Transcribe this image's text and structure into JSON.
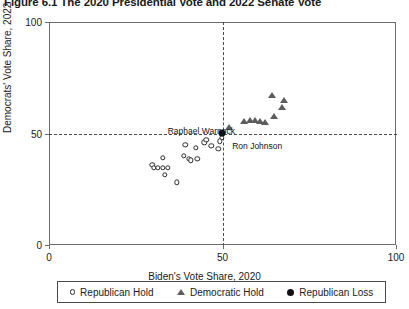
{
  "title": "Figure 6.1  The 2020 Presidential Vote and 2022 Senate Vote",
  "annotations": [
    {
      "name": "raphael-warnock",
      "text": "Raphael Warnock",
      "x": 36.0,
      "y": 51.5
    },
    {
      "name": "ron-johnson",
      "text": "Ron Johnson",
      "x": 52.5,
      "y": 45.0
    }
  ],
  "legend": {
    "items": [
      {
        "name": "republican-hold",
        "label": "Republican Hold",
        "marker": "open-circle",
        "color": "#2b2b2b"
      },
      {
        "name": "democratic-hold",
        "label": "Democratic Hold",
        "marker": "filled-triangle",
        "color": "#5d5d5d"
      },
      {
        "name": "republican-loss",
        "label": "Republican Loss",
        "marker": "filled-circle",
        "color": "#111111"
      }
    ]
  },
  "chart_data": {
    "type": "scatter",
    "title": "Figure 6.1  The 2020 Presidential Vote and 2022 Senate Vote",
    "xlabel": "Biden's Vote Share, 2020",
    "ylabel": "Democrats' Vote Share, 2022",
    "xlim": [
      0,
      100
    ],
    "ylim": [
      0,
      100
    ],
    "xticks": [
      0,
      50,
      100
    ],
    "yticks": [
      0,
      50,
      100
    ],
    "grid": false,
    "reference_lines": [
      {
        "name": "vertical-50",
        "axis": "x",
        "value": 50,
        "style": "dashed"
      },
      {
        "name": "horizontal-50",
        "axis": "y",
        "value": 50,
        "style": "dashed"
      }
    ],
    "legend_position": "below-axes",
    "series": [
      {
        "name": "Republican Hold",
        "marker": "open-circle",
        "color": "#2b2b2b",
        "points": [
          {
            "x": 39.0,
            "y": 45.5
          },
          {
            "x": 42.0,
            "y": 44.0
          },
          {
            "x": 44.5,
            "y": 46.5
          },
          {
            "x": 45.0,
            "y": 47.5
          },
          {
            "x": 46.5,
            "y": 45.0
          },
          {
            "x": 48.5,
            "y": 43.5
          },
          {
            "x": 49.5,
            "y": 48.5
          },
          {
            "x": 49.0,
            "y": 47.0
          },
          {
            "x": 38.5,
            "y": 40.5
          },
          {
            "x": 40.0,
            "y": 39.0
          },
          {
            "x": 40.5,
            "y": 38.5
          },
          {
            "x": 42.5,
            "y": 39.0
          },
          {
            "x": 32.5,
            "y": 39.5
          },
          {
            "x": 29.5,
            "y": 36.5
          },
          {
            "x": 30.0,
            "y": 35.0
          },
          {
            "x": 31.0,
            "y": 35.0
          },
          {
            "x": 32.5,
            "y": 35.0
          },
          {
            "x": 34.0,
            "y": 35.0
          },
          {
            "x": 33.0,
            "y": 32.0
          },
          {
            "x": 36.5,
            "y": 28.5
          }
        ]
      },
      {
        "name": "Democratic Hold",
        "marker": "filled-triangle",
        "color": "#5d5d5d",
        "points": [
          {
            "x": 51.5,
            "y": 53.5
          },
          {
            "x": 56.0,
            "y": 56.0
          },
          {
            "x": 57.5,
            "y": 56.5
          },
          {
            "x": 59.0,
            "y": 56.5
          },
          {
            "x": 60.5,
            "y": 56.0
          },
          {
            "x": 62.0,
            "y": 55.5
          },
          {
            "x": 64.5,
            "y": 58.5
          },
          {
            "x": 64.0,
            "y": 67.5
          },
          {
            "x": 67.0,
            "y": 62.5
          },
          {
            "x": 67.5,
            "y": 65.5
          }
        ]
      },
      {
        "name": "Republican Loss",
        "marker": "filled-circle",
        "color": "#111111",
        "points": [
          {
            "x": 49.5,
            "y": 50.8
          }
        ]
      }
    ]
  }
}
